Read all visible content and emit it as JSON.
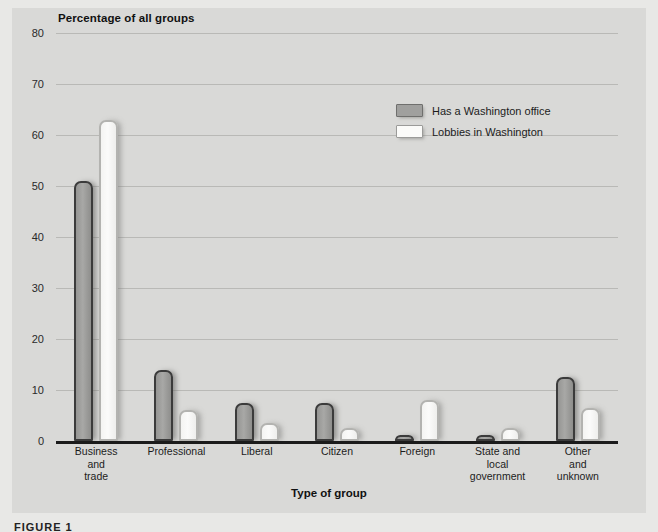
{
  "figure": {
    "background_color": "#e8e8e6",
    "panel_color": "#d9d9d7",
    "caption": "FIGURE 1"
  },
  "legend": {
    "position": "upper-right-inside",
    "entries": [
      {
        "label": "Has a Washington office",
        "swatch": "dark-gray-swatch",
        "color": "#a0a09e"
      },
      {
        "label": "Lobbies in Washington",
        "swatch": "white-swatch",
        "color": "#fbfbf9"
      }
    ]
  },
  "chart_data": {
    "type": "bar",
    "title": "Percentage of all groups",
    "xlabel": "Type of group",
    "ylabel": "Percentage of all groups",
    "grid": true,
    "ylim": [
      0,
      80
    ],
    "yticks": [
      0,
      10,
      20,
      30,
      40,
      50,
      60,
      70,
      80
    ],
    "ytick_labels": [
      "0",
      "10",
      "20",
      "30",
      "40",
      "50",
      "60",
      "70",
      "80"
    ],
    "categories": [
      "Business and trade",
      "Professional",
      "Liberal",
      "Citizen",
      "Foreign",
      "State and local government",
      "Other and unknown"
    ],
    "category_lines": [
      [
        "Business",
        "and",
        "trade"
      ],
      [
        "Professional"
      ],
      [
        "Liberal"
      ],
      [
        "Citizen"
      ],
      [
        "Foreign"
      ],
      [
        "State and",
        "local",
        "government"
      ],
      [
        "Other",
        "and",
        "unknown"
      ]
    ],
    "series": [
      {
        "name": "Has a Washington office",
        "color": "#a0a09e",
        "values": [
          51,
          14,
          7.5,
          7.5,
          1,
          0.7,
          12.5
        ]
      },
      {
        "name": "Lobbies in Washington",
        "color": "#fbfbf9",
        "values": [
          63,
          6,
          3.5,
          2.5,
          8,
          2.5,
          6.5
        ]
      }
    ]
  }
}
